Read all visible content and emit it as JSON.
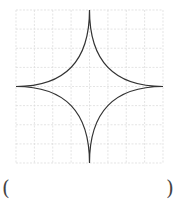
{
  "figure": {
    "type": "astroid-on-grid",
    "grid": {
      "columns": 8,
      "rows": 8,
      "color": "#d8d8d8",
      "dashed": true
    },
    "curve_color": "#333333"
  },
  "answer": {
    "left_paren": "(",
    "right_paren": ")",
    "value": ""
  }
}
